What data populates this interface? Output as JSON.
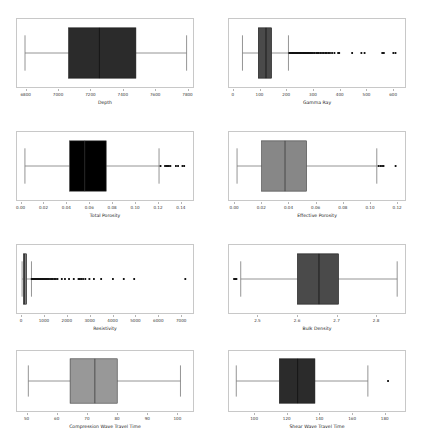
{
  "figure": {
    "title": "",
    "background_color": "#ffffff",
    "frame_color": "#c8c8c8",
    "rows": 4,
    "cols": 2
  },
  "chart_data": [
    {
      "type": "box",
      "name": "depth",
      "title": "",
      "xlabel": "Depth",
      "ylabel": "",
      "orientation": "horizontal",
      "xlim": [
        6740,
        7840
      ],
      "ticks": [
        6800,
        7000,
        7200,
        7400,
        7600,
        7800
      ],
      "ticklabels": [
        "6800",
        "7000",
        "7200",
        "7400",
        "7600",
        "7800"
      ],
      "box_color": "#2b2b2b",
      "median_color": "#111111",
      "whisker_color": "#777777",
      "stats": {
        "whisker_low": 6790,
        "q1": 7063,
        "median": 7255,
        "q3": 7483,
        "whisker_high": 7800
      },
      "outliers": []
    },
    {
      "type": "box",
      "name": "gamma-ray",
      "title": "",
      "xlabel": "Gamma Ray",
      "ylabel": "",
      "orientation": "horizontal",
      "xlim": [
        -18,
        648
      ],
      "ticks": [
        0,
        100,
        200,
        300,
        400,
        500,
        600
      ],
      "ticklabels": [
        "0",
        "100",
        "200",
        "300",
        "400",
        "500",
        "600"
      ],
      "box_color": "#4a4a4a",
      "median_color": "#111111",
      "whisker_color": "#777777",
      "stats": {
        "whisker_low": 33,
        "q1": 93,
        "median": 122,
        "q3": 143,
        "whisker_high": 207
      },
      "outliers": [
        210,
        214,
        218,
        221,
        224,
        227,
        230,
        233,
        236,
        239,
        242,
        245,
        248,
        251,
        254,
        257,
        260,
        263,
        266,
        269,
        272,
        275,
        278,
        281,
        284,
        288,
        292,
        296,
        300,
        306,
        312,
        318,
        322,
        328,
        334,
        340,
        346,
        352,
        358,
        364,
        372,
        381,
        395,
        399,
        448,
        483,
        495,
        562,
        568,
        604,
        612
      ],
      "outlier_color": "#111111"
    },
    {
      "type": "box",
      "name": "total-porosity",
      "title": "",
      "xlabel": "Total Porosity",
      "ylabel": "",
      "orientation": "horizontal",
      "xlim": [
        -0.004,
        0.1515
      ],
      "ticks": [
        0.0,
        0.02,
        0.04,
        0.06,
        0.08,
        0.1,
        0.12,
        0.14
      ],
      "ticklabels": [
        "0.00",
        "0.02",
        "0.04",
        "0.06",
        "0.08",
        "0.10",
        "0.12",
        "0.14"
      ],
      "box_color": "#000000",
      "median_color": "#333333",
      "whisker_color": "#777777",
      "stats": {
        "whisker_low": 0.003,
        "q1": 0.0425,
        "median": 0.0558,
        "q3": 0.0748,
        "whisker_high": 0.1215
      },
      "outliers": [
        0.1228,
        0.1268,
        0.1281,
        0.129,
        0.1302,
        0.1315,
        0.1364,
        0.1383,
        0.1422,
        0.1437
      ],
      "outlier_color": "#111111"
    },
    {
      "type": "box",
      "name": "effective-porosity",
      "title": "",
      "xlabel": "Effective Porosity",
      "ylabel": "",
      "orientation": "horizontal",
      "xlim": [
        -0.0045,
        0.1265
      ],
      "ticks": [
        0.0,
        0.02,
        0.04,
        0.06,
        0.08,
        0.1,
        0.12
      ],
      "ticklabels": [
        "0.00",
        "0.02",
        "0.04",
        "0.06",
        "0.08",
        "0.10",
        "0.12"
      ],
      "box_color": "#878787",
      "median_color": "#3a3a3a",
      "whisker_color": "#777777",
      "stats": {
        "whisker_low": 0.0015,
        "q1": 0.0198,
        "median": 0.0372,
        "q3": 0.0532,
        "whisker_high": 0.1055
      },
      "outliers": [
        0.1068,
        0.1082,
        0.1094,
        0.1105,
        0.1195
      ],
      "outlier_color": "#111111"
    },
    {
      "type": "box",
      "name": "resistivity",
      "title": "",
      "xlabel": "Resistivity",
      "ylabel": "",
      "orientation": "horizontal",
      "xlim": [
        -220,
        7560
      ],
      "ticks": [
        0,
        1000,
        2000,
        3000,
        4000,
        5000,
        6000,
        7000
      ],
      "ticklabels": [
        "0",
        "1000",
        "2000",
        "3000",
        "4000",
        "5000",
        "6000",
        "7000"
      ],
      "box_color": "#8a8a8a",
      "median_color": "#111111",
      "whisker_color": "#777777",
      "stats": {
        "whisker_low": 5,
        "q1": 60,
        "median": 118,
        "q3": 205,
        "whisker_high": 420
      },
      "outliers": [
        430,
        450,
        470,
        490,
        510,
        530,
        555,
        580,
        605,
        630,
        660,
        690,
        720,
        750,
        785,
        820,
        860,
        900,
        940,
        985,
        1030,
        1080,
        1130,
        1185,
        1240,
        1300,
        1365,
        1430,
        1500,
        1570,
        1760,
        1900,
        2080,
        2290,
        2500,
        2560,
        2620,
        2700,
        2800,
        2980,
        3180,
        3500,
        4020,
        4500,
        4960,
        7220
      ],
      "outlier_color": "#111111"
    },
    {
      "type": "box",
      "name": "bulk-density",
      "title": "",
      "xlabel": "Bulk Density",
      "ylabel": "",
      "orientation": "horizontal",
      "xlim": [
        2.4255,
        2.8755
      ],
      "ticks": [
        2.5,
        2.6,
        2.7,
        2.8
      ],
      "ticklabels": [
        "2.5",
        "2.6",
        "2.7",
        "2.8"
      ],
      "box_color": "#4a4a4a",
      "median_color": "#111111",
      "whisker_color": "#777777",
      "stats": {
        "whisker_low": 2.4555,
        "q1": 2.6005,
        "median": 2.6555,
        "q3": 2.7055,
        "whisker_high": 2.8555
      },
      "outliers": [
        2.4385,
        2.4415,
        2.4445
      ],
      "outlier_color": "#111111"
    },
    {
      "type": "box",
      "name": "compression-wave-travel-time",
      "title": "",
      "xlabel": "Compression Wave Travel Time",
      "ylabel": "",
      "orientation": "horizontal",
      "xlim": [
        46.5,
        105.5
      ],
      "ticks": [
        50,
        60,
        70,
        80,
        90,
        100
      ],
      "ticklabels": [
        "50",
        "60",
        "70",
        "80",
        "90",
        "100"
      ],
      "box_color": "#989898",
      "median_color": "#3a3a3a",
      "whisker_color": "#777777",
      "stats": {
        "whisker_low": 50.3,
        "q1": 64.3,
        "median": 72.6,
        "q3": 80.1,
        "whisker_high": 101.3
      },
      "outliers": [],
      "outlier_color": "#111111"
    },
    {
      "type": "box",
      "name": "shear-wave-travel-time",
      "title": "",
      "xlabel": "Shear Wave Travel Time",
      "ylabel": "",
      "orientation": "horizontal",
      "xlim": [
        84,
        193
      ],
      "ticks": [
        100,
        120,
        140,
        160,
        180
      ],
      "ticklabels": [
        "100",
        "120",
        "140",
        "160",
        "180"
      ],
      "box_color": "#2b2b2b",
      "median_color": "#111111",
      "whisker_color": "#777777",
      "stats": {
        "whisker_low": 88.5,
        "q1": 115.2,
        "median": 126.5,
        "q3": 137.2,
        "whisker_high": 170.0
      },
      "outliers": [
        182.5
      ],
      "outlier_color": "#111111"
    }
  ]
}
